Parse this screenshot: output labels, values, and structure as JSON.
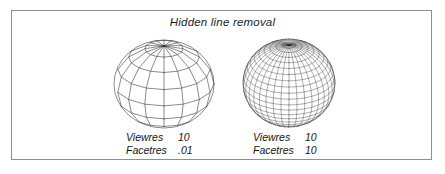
{
  "figure": {
    "title": "Hidden line removal",
    "background_color": "#ffffff",
    "border_color": "#8e8e8e",
    "line_color": "#2b2b2b"
  },
  "panels": [
    {
      "id": "coarse",
      "caption": {
        "viewres_label": "Viewres",
        "viewres_value": "10",
        "facetres_label": "Facetres",
        "facetres_value": ".01"
      },
      "sphere": {
        "meridians": 16,
        "parallels": 8,
        "style": "faceted-polygonal"
      }
    },
    {
      "id": "fine",
      "caption": {
        "viewres_label": "Viewres",
        "viewres_value": "10",
        "facetres_label": "Facetres",
        "facetres_value": "10"
      },
      "sphere": {
        "meridians": 36,
        "parallels": 22,
        "style": "dense-smooth"
      }
    }
  ]
}
